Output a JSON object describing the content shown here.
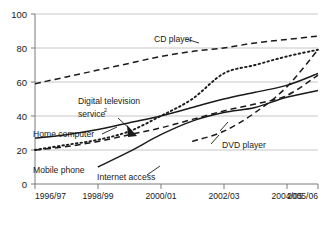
{
  "chart_data": {
    "type": "line",
    "title": "",
    "subtitle": "",
    "xlabel": "",
    "ylabel": "",
    "ylim": [
      0,
      100
    ],
    "yticks": [
      0,
      20,
      40,
      60,
      80,
      100
    ],
    "ytick_labels": [
      "0",
      "20",
      "40",
      "60",
      "80",
      "100"
    ],
    "grid": true,
    "legend_position": "inline-annotations",
    "x": [
      "1996/97",
      "1997/98",
      "1998/99",
      "1999/00",
      "2000/01",
      "2001/02",
      "2002/03",
      "2003/04",
      "2004/05",
      "2005/06"
    ],
    "xtick_labels": [
      "1996/97",
      "1998/99",
      "2000/01",
      "2002/03",
      "2004/05",
      "2005/06"
    ],
    "xtick_positions": [
      0,
      2,
      4,
      6,
      8,
      9
    ],
    "series": [
      {
        "name": "CD player",
        "style": "dashed",
        "label": "CD player",
        "values": [
          59,
          63,
          67,
          71,
          75,
          78,
          80,
          83,
          85,
          87
        ]
      },
      {
        "name": "Digital television service",
        "style": "dotted",
        "label": "Digital television service",
        "label_superscript": "2",
        "values": [
          20,
          23,
          26,
          31,
          40,
          50,
          65,
          70,
          75,
          79
        ]
      },
      {
        "name": "Home computer",
        "style": "solid",
        "label": "Home computer",
        "values": [
          27,
          29,
          32,
          36,
          40,
          45,
          50,
          54,
          58,
          65
        ]
      },
      {
        "name": "Mobile phone",
        "style": "dashed",
        "label": "Mobile phone",
        "values": [
          20,
          22,
          25,
          29,
          33,
          38,
          43,
          47,
          52,
          64
        ]
      },
      {
        "name": "Internet access",
        "style": "solid",
        "label": "Internet access",
        "values": [
          null,
          null,
          10,
          19,
          29,
          37,
          42,
          45,
          51,
          55
        ]
      },
      {
        "name": "DVD player",
        "style": "dashed",
        "label": "DVD player",
        "values": [
          null,
          null,
          null,
          null,
          null,
          25,
          31,
          42,
          57,
          79
        ]
      }
    ],
    "annotations": [
      {
        "text": "CD player",
        "x_pct": 47,
        "y_value": 85
      },
      {
        "text": "Digital television",
        "x_pct": 26,
        "y_value": 52
      },
      {
        "text": "service",
        "x_pct": 26,
        "y_value": 46
      },
      {
        "text": "Home computer",
        "x_pct": 10,
        "y_value": 36
      },
      {
        "text": "Mobile phone",
        "x_pct": 10,
        "y_value": 16
      },
      {
        "text": "Internet access",
        "x_pct": 32,
        "y_value": 13
      },
      {
        "text": "DVD player",
        "x_pct": 68,
        "y_value": 24
      }
    ]
  }
}
